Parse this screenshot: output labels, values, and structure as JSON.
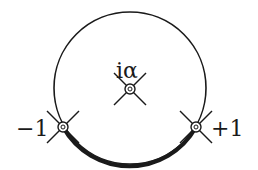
{
  "diagram": {
    "type": "contour-diagram",
    "stroke_color": "#1a1a1a",
    "background": "#ffffff",
    "circle": {
      "cx": 130,
      "cy": 88,
      "r": 76
    },
    "highlighted_arc": {
      "from": "-1",
      "to": "+1",
      "side": "lower"
    },
    "points": [
      {
        "id": "minus-one",
        "label": "−1",
        "x": 63,
        "y": 127,
        "label_x": 20,
        "label_y": 136
      },
      {
        "id": "i-alpha",
        "label": "iα",
        "x": 130,
        "y": 89,
        "label_x": 116,
        "label_y": 78
      },
      {
        "id": "plus-one",
        "label": "+1",
        "x": 196,
        "y": 127,
        "label_x": 210,
        "label_y": 136
      }
    ]
  }
}
